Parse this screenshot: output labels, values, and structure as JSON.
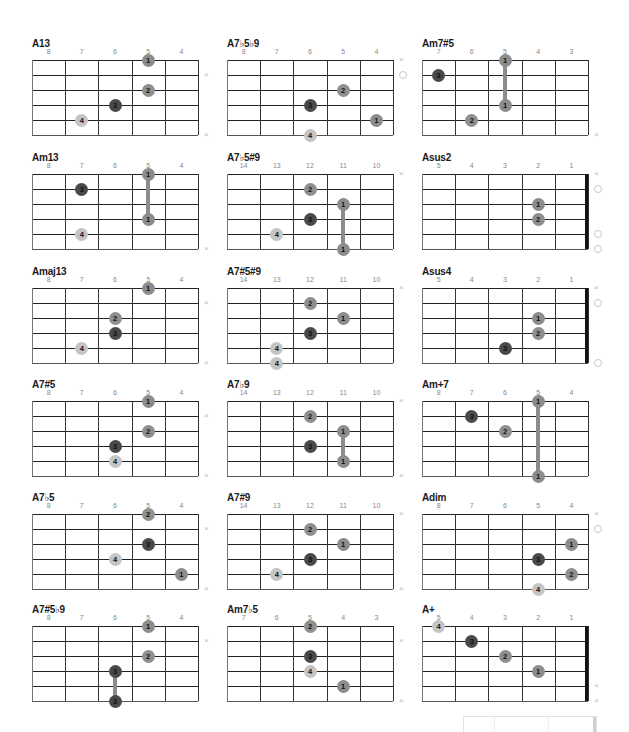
{
  "chart_data": {
    "type": "chord-diagrams",
    "chords": [
      {
        "name": "A13",
        "frets": [
          "8",
          "7",
          "6",
          "5",
          "4"
        ],
        "nut": false,
        "dots": [
          {
            "string": 1,
            "fret_col": 4,
            "finger": "1"
          },
          {
            "string": 3,
            "fret_col": 4,
            "finger": "2"
          },
          {
            "string": 4,
            "fret_col": 3,
            "finger": "3"
          },
          {
            "string": 5,
            "fret_col": 2,
            "finger": "4"
          }
        ],
        "barres": [],
        "markers": [
          {
            "string": 2,
            "type": "x"
          },
          {
            "string": 6,
            "type": "x"
          }
        ]
      },
      {
        "name": "A7♭5♭9",
        "frets": [
          "8",
          "7",
          "6",
          "5",
          "4"
        ],
        "nut": false,
        "dots": [
          {
            "string": 3,
            "fret_col": 4,
            "finger": "2"
          },
          {
            "string": 4,
            "fret_col": 3,
            "finger": "3"
          },
          {
            "string": 5,
            "fret_col": 5,
            "finger": "1"
          },
          {
            "string": 6,
            "fret_col": 3,
            "finger": "4"
          }
        ],
        "barres": [],
        "markers": [
          {
            "string": 1,
            "type": "x"
          },
          {
            "string": 2,
            "type": "o"
          }
        ]
      },
      {
        "name": "Am7#5",
        "frets": [
          "7",
          "6",
          "5",
          "4",
          "3"
        ],
        "nut": false,
        "dots": [
          {
            "string": 1,
            "fret_col": 3,
            "finger": "1"
          },
          {
            "string": 2,
            "fret_col": 1,
            "finger": "3"
          },
          {
            "string": 4,
            "fret_col": 3,
            "finger": "1"
          },
          {
            "string": 5,
            "fret_col": 2,
            "finger": "2"
          }
        ],
        "barres": [
          {
            "fret_col": 3,
            "from": 1,
            "to": 4
          }
        ],
        "markers": [
          {
            "string": 6,
            "type": "x"
          }
        ]
      },
      {
        "name": "Am13",
        "frets": [
          "8",
          "7",
          "6",
          "5",
          "4"
        ],
        "nut": false,
        "dots": [
          {
            "string": 1,
            "fret_col": 4,
            "finger": "1"
          },
          {
            "string": 2,
            "fret_col": 2,
            "finger": "3"
          },
          {
            "string": 4,
            "fret_col": 4,
            "finger": "1"
          },
          {
            "string": 5,
            "fret_col": 2,
            "finger": "4"
          }
        ],
        "barres": [
          {
            "fret_col": 4,
            "from": 1,
            "to": 4
          }
        ],
        "markers": [
          {
            "string": 6,
            "type": "x"
          }
        ]
      },
      {
        "name": "A7♭5#9",
        "frets": [
          "14",
          "13",
          "12",
          "11",
          "10"
        ],
        "nut": false,
        "dots": [
          {
            "string": 2,
            "fret_col": 3,
            "finger": "2"
          },
          {
            "string": 3,
            "fret_col": 4,
            "finger": "1"
          },
          {
            "string": 4,
            "fret_col": 3,
            "finger": "3"
          },
          {
            "string": 5,
            "fret_col": 2,
            "finger": "4"
          },
          {
            "string": 6,
            "fret_col": 4,
            "finger": "1"
          }
        ],
        "barres": [
          {
            "fret_col": 4,
            "from": 3,
            "to": 6
          }
        ],
        "markers": [
          {
            "string": 1,
            "type": "x"
          }
        ]
      },
      {
        "name": "Asus2",
        "frets": [
          "5",
          "4",
          "3",
          "2",
          "1"
        ],
        "nut": true,
        "dots": [
          {
            "string": 3,
            "fret_col": 4,
            "finger": "1"
          },
          {
            "string": 4,
            "fret_col": 4,
            "finger": "2"
          }
        ],
        "barres": [],
        "markers": [
          {
            "string": 1,
            "type": "x"
          },
          {
            "string": 2,
            "type": "o"
          },
          {
            "string": 5,
            "type": "o"
          },
          {
            "string": 6,
            "type": "o"
          }
        ]
      },
      {
        "name": "Amaj13",
        "frets": [
          "8",
          "7",
          "6",
          "5",
          "4"
        ],
        "nut": false,
        "dots": [
          {
            "string": 1,
            "fret_col": 4,
            "finger": "1"
          },
          {
            "string": 3,
            "fret_col": 3,
            "finger": "2"
          },
          {
            "string": 4,
            "fret_col": 3,
            "finger": "3"
          },
          {
            "string": 5,
            "fret_col": 2,
            "finger": "4"
          }
        ],
        "barres": [],
        "markers": [
          {
            "string": 2,
            "type": "x"
          },
          {
            "string": 6,
            "type": "x"
          }
        ]
      },
      {
        "name": "A7#5#9",
        "frets": [
          "14",
          "13",
          "12",
          "11",
          "10"
        ],
        "nut": false,
        "dots": [
          {
            "string": 2,
            "fret_col": 3,
            "finger": "2"
          },
          {
            "string": 3,
            "fret_col": 4,
            "finger": "1"
          },
          {
            "string": 4,
            "fret_col": 3,
            "finger": "3"
          },
          {
            "string": 5,
            "fret_col": 2,
            "finger": "4"
          },
          {
            "string": 6,
            "fret_col": 2,
            "finger": "4"
          }
        ],
        "barres": [],
        "markers": [
          {
            "string": 1,
            "type": "x"
          }
        ]
      },
      {
        "name": "Asus4",
        "frets": [
          "5",
          "4",
          "3",
          "2",
          "1"
        ],
        "nut": true,
        "dots": [
          {
            "string": 3,
            "fret_col": 4,
            "finger": "1"
          },
          {
            "string": 4,
            "fret_col": 4,
            "finger": "2"
          },
          {
            "string": 5,
            "fret_col": 3,
            "finger": "3"
          }
        ],
        "barres": [],
        "markers": [
          {
            "string": 1,
            "type": "x"
          },
          {
            "string": 2,
            "type": "o"
          },
          {
            "string": 6,
            "type": "o"
          }
        ]
      },
      {
        "name": "A7#5",
        "frets": [
          "8",
          "7",
          "6",
          "5",
          "4"
        ],
        "nut": false,
        "dots": [
          {
            "string": 1,
            "fret_col": 4,
            "finger": "1"
          },
          {
            "string": 3,
            "fret_col": 4,
            "finger": "2"
          },
          {
            "string": 4,
            "fret_col": 3,
            "finger": "3"
          },
          {
            "string": 5,
            "fret_col": 3,
            "finger": "4"
          }
        ],
        "barres": [],
        "markers": [
          {
            "string": 2,
            "type": "x"
          },
          {
            "string": 6,
            "type": "x"
          }
        ]
      },
      {
        "name": "A7♭9",
        "frets": [
          "14",
          "13",
          "12",
          "11",
          "10"
        ],
        "nut": false,
        "dots": [
          {
            "string": 2,
            "fret_col": 3,
            "finger": "2"
          },
          {
            "string": 3,
            "fret_col": 4,
            "finger": "1"
          },
          {
            "string": 4,
            "fret_col": 3,
            "finger": "3"
          },
          {
            "string": 5,
            "fret_col": 4,
            "finger": "1"
          }
        ],
        "barres": [
          {
            "fret_col": 4,
            "from": 3,
            "to": 5
          }
        ],
        "markers": [
          {
            "string": 1,
            "type": "x"
          },
          {
            "string": 6,
            "type": "x"
          }
        ]
      },
      {
        "name": "Am+7",
        "frets": [
          "8",
          "7",
          "6",
          "5",
          "4"
        ],
        "nut": false,
        "dots": [
          {
            "string": 1,
            "fret_col": 4,
            "finger": "1"
          },
          {
            "string": 2,
            "fret_col": 2,
            "finger": "3"
          },
          {
            "string": 3,
            "fret_col": 3,
            "finger": "2"
          },
          {
            "string": 6,
            "fret_col": 4,
            "finger": "1"
          }
        ],
        "barres": [
          {
            "fret_col": 4,
            "from": 1,
            "to": 6
          }
        ],
        "markers": []
      },
      {
        "name": "A7♭5",
        "frets": [
          "8",
          "7",
          "6",
          "5",
          "4"
        ],
        "nut": false,
        "dots": [
          {
            "string": 1,
            "fret_col": 4,
            "finger": "2"
          },
          {
            "string": 3,
            "fret_col": 4,
            "finger": "3"
          },
          {
            "string": 4,
            "fret_col": 3,
            "finger": "4"
          },
          {
            "string": 5,
            "fret_col": 5,
            "finger": "1"
          }
        ],
        "barres": [],
        "markers": [
          {
            "string": 2,
            "type": "x"
          },
          {
            "string": 6,
            "type": "x"
          }
        ]
      },
      {
        "name": "A7#9",
        "frets": [
          "14",
          "13",
          "12",
          "11",
          "10"
        ],
        "nut": false,
        "dots": [
          {
            "string": 2,
            "fret_col": 3,
            "finger": "2"
          },
          {
            "string": 3,
            "fret_col": 4,
            "finger": "1"
          },
          {
            "string": 4,
            "fret_col": 3,
            "finger": "3"
          },
          {
            "string": 5,
            "fret_col": 2,
            "finger": "4"
          }
        ],
        "barres": [],
        "markers": [
          {
            "string": 1,
            "type": "x"
          },
          {
            "string": 6,
            "type": "x"
          }
        ]
      },
      {
        "name": "Adim",
        "frets": [
          "8",
          "7",
          "6",
          "5",
          "4"
        ],
        "nut": false,
        "dots": [
          {
            "string": 3,
            "fret_col": 5,
            "finger": "1"
          },
          {
            "string": 4,
            "fret_col": 4,
            "finger": "3"
          },
          {
            "string": 5,
            "fret_col": 5,
            "finger": "2"
          },
          {
            "string": 6,
            "fret_col": 4,
            "finger": "4"
          }
        ],
        "barres": [],
        "markers": [
          {
            "string": 1,
            "type": "x"
          },
          {
            "string": 2,
            "type": "o"
          }
        ]
      },
      {
        "name": "A7#5♭9",
        "frets": [
          "8",
          "7",
          "6",
          "5",
          "4"
        ],
        "nut": false,
        "dots": [
          {
            "string": 1,
            "fret_col": 4,
            "finger": "1"
          },
          {
            "string": 3,
            "fret_col": 4,
            "finger": "2"
          },
          {
            "string": 4,
            "fret_col": 3,
            "finger": "3"
          },
          {
            "string": 6,
            "fret_col": 3,
            "finger": "3"
          }
        ],
        "barres": [
          {
            "fret_col": 3,
            "from": 4,
            "to": 6
          }
        ],
        "markers": [
          {
            "string": 2,
            "type": "x"
          }
        ]
      },
      {
        "name": "Am7♭5",
        "frets": [
          "7",
          "6",
          "5",
          "4",
          "3"
        ],
        "nut": false,
        "dots": [
          {
            "string": 1,
            "fret_col": 3,
            "finger": "2"
          },
          {
            "string": 3,
            "fret_col": 3,
            "finger": "3"
          },
          {
            "string": 4,
            "fret_col": 3,
            "finger": "4"
          },
          {
            "string": 5,
            "fret_col": 4,
            "finger": "1"
          }
        ],
        "barres": [],
        "markers": [
          {
            "string": 2,
            "type": "x"
          },
          {
            "string": 6,
            "type": "x"
          }
        ]
      },
      {
        "name": "A+",
        "frets": [
          "5",
          "4",
          "3",
          "2",
          "1"
        ],
        "nut": true,
        "dots": [
          {
            "string": 1,
            "fret_col": 1,
            "finger": "4"
          },
          {
            "string": 2,
            "fret_col": 2,
            "finger": "3"
          },
          {
            "string": 3,
            "fret_col": 3,
            "finger": "2"
          },
          {
            "string": 4,
            "fret_col": 4,
            "finger": "1"
          }
        ],
        "barres": [],
        "markers": [
          {
            "string": 5,
            "type": "x"
          },
          {
            "string": 6,
            "type": "x"
          }
        ]
      }
    ]
  }
}
